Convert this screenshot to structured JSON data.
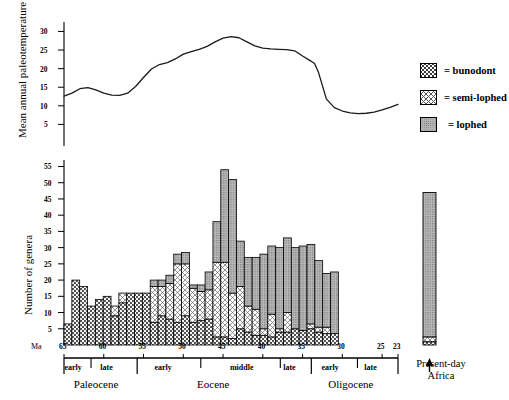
{
  "figure": {
    "ma_label": "Ma",
    "present_day_label_line1": "Present-day",
    "present_day_label_line2": "Africa"
  },
  "legend": {
    "items": [
      {
        "key": "bunodont",
        "label": "= bunodont",
        "pattern": "dotted-grid",
        "color": "#8a8a8a"
      },
      {
        "key": "semi-lophed",
        "label": "= semi-lophed",
        "pattern": "cross-hatch",
        "color": "#bdbdbd"
      },
      {
        "key": "lophed",
        "label": "= lophed",
        "pattern": "stipple-gray",
        "color": "#9e9e9e"
      }
    ]
  },
  "chart_data": [
    {
      "id": "paleotemperature",
      "type": "line",
      "title": "",
      "ylabel": "Mean annual paleotemperature at 45° north",
      "xlabel": "Ma",
      "ylim": [
        0,
        32
      ],
      "yticks": [
        5,
        10,
        15,
        20,
        25,
        30
      ],
      "xlim": [
        65,
        23
      ],
      "grid": false,
      "legend": "none",
      "x": [
        65,
        64,
        63,
        62,
        61,
        60,
        59,
        58,
        57,
        56,
        55,
        54,
        53,
        52,
        51,
        50,
        49,
        48,
        47,
        46,
        45,
        44,
        43,
        42,
        41,
        40,
        39,
        38,
        37,
        36,
        35,
        34,
        33.5,
        33,
        32,
        31,
        30,
        29,
        28,
        27,
        26,
        25,
        24,
        23
      ],
      "y": [
        12.6,
        13.4,
        14.6,
        14.9,
        14.3,
        13.4,
        12.9,
        12.8,
        13.4,
        15.2,
        17.6,
        19.9,
        21.1,
        21.6,
        22.6,
        23.9,
        24.6,
        25.2,
        26.0,
        27.2,
        28.2,
        28.6,
        28.3,
        27.2,
        26.1,
        25.5,
        25.3,
        25.2,
        25.1,
        24.8,
        23.4,
        22.1,
        21.4,
        19.0,
        11.8,
        9.5,
        8.6,
        8.1,
        7.9,
        8.0,
        8.3,
        8.9,
        9.6,
        10.4
      ]
    },
    {
      "id": "genera-counts",
      "type": "bar",
      "subtype": "stacked",
      "title": "",
      "ylabel": "Number of genera",
      "xlabel": "Ma",
      "ylim": [
        0,
        57
      ],
      "yticks": [
        5,
        10,
        15,
        20,
        25,
        30,
        35,
        40,
        45,
        50,
        55
      ],
      "xlim": [
        65,
        23
      ],
      "xticks": [
        65,
        60,
        55,
        50,
        45,
        40,
        35,
        30,
        25,
        23
      ],
      "grid": false,
      "legend_position": "top-right",
      "series": [
        {
          "name": "bunodont",
          "values": [
            6.5,
            20,
            18,
            12,
            14,
            15,
            9,
            13,
            16,
            16,
            16,
            7,
            9,
            8,
            7,
            9,
            7,
            7.5,
            8,
            2.5,
            2.5,
            2,
            5,
            4,
            3,
            3,
            2.5,
            4,
            4,
            5,
            4.5,
            5,
            4,
            3.5,
            3.5
          ]
        },
        {
          "name": "semi-lophed",
          "values": [
            0,
            0,
            0,
            0,
            0,
            0,
            3,
            3,
            0,
            0,
            0,
            11,
            9,
            11,
            18,
            16,
            10.5,
            9,
            9,
            23,
            23,
            14,
            13,
            8,
            8,
            2,
            7,
            1,
            6,
            0,
            0,
            1.5,
            1.5,
            2,
            0
          ]
        },
        {
          "name": "lophed",
          "values": [
            0,
            0,
            0,
            0,
            0,
            0,
            0,
            0,
            0,
            0,
            0,
            2,
            2,
            2.5,
            3,
            3.5,
            1,
            2,
            5.5,
            12.5,
            28.5,
            35,
            14,
            15,
            16,
            23,
            21,
            25,
            23,
            25,
            26,
            24.5,
            20.5,
            16.5,
            19
          ]
        },
        {
          "name": "labels_x",
          "values": [
            65,
            64,
            63,
            62,
            61,
            60,
            59,
            58,
            57,
            56,
            55,
            54,
            53,
            52,
            51,
            50,
            49,
            48,
            47,
            46,
            45,
            44,
            43,
            42,
            41,
            40,
            39,
            38,
            37,
            36,
            35,
            34,
            33,
            32,
            31
          ]
        }
      ],
      "totals": [
        6.5,
        20,
        18,
        12,
        14,
        15,
        12,
        16,
        16,
        16,
        16,
        20,
        20,
        21.5,
        28,
        28.5,
        18.5,
        18.5,
        22.5,
        38,
        54,
        51,
        32,
        27,
        27,
        28,
        30.5,
        30,
        33,
        30,
        30.5,
        31,
        26,
        22,
        22.5
      ],
      "present_day_africa": {
        "label_line1": "Present-day",
        "label_line2": "Africa",
        "bunodont": 1.0,
        "semi_lophed": 1.5,
        "lophed": 44.5,
        "total": 47
      }
    }
  ],
  "axes": {
    "temp": {
      "title": "Mean annual paleotemperature at 45° north",
      "tick_labels": [
        "30",
        "25",
        "20",
        "15",
        "10",
        "5"
      ]
    },
    "genera": {
      "title": "Number of genera",
      "tick_labels": [
        "55",
        "50",
        "45",
        "40",
        "35",
        "30",
        "25",
        "20",
        "15",
        "10",
        "5"
      ],
      "x_tick_labels": [
        "65",
        "60",
        "55",
        "50",
        "45",
        "40",
        "35",
        "30",
        "25",
        "23"
      ]
    }
  },
  "timescale": {
    "epochs": [
      {
        "name": "Paleocene",
        "subdivisions": [
          {
            "label": "early"
          },
          {
            "label": "late"
          }
        ]
      },
      {
        "name": "Eocene",
        "subdivisions": [
          {
            "label": "early"
          },
          {
            "label": "middle"
          },
          {
            "label": "late"
          }
        ]
      },
      {
        "name": "Oligocene",
        "subdivisions": [
          {
            "label": "early"
          },
          {
            "label": "late"
          }
        ]
      }
    ]
  }
}
